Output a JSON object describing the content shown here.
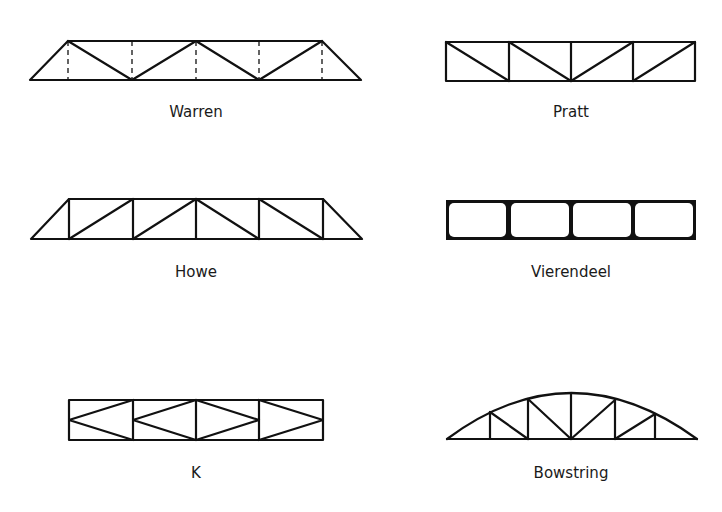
{
  "figure": {
    "colors": {
      "line": "#111111",
      "background": "#ffffff",
      "text": "#1a1a1a"
    }
  },
  "trusses": [
    {
      "id": "warren",
      "label": "Warren",
      "shape": "trapezoid",
      "panels": 4,
      "verticals": "dashed (zero-force)",
      "diagonals": "alternating V pattern"
    },
    {
      "id": "pratt",
      "label": "Pratt",
      "shape": "rectangle",
      "panels": 4,
      "verticals": "solid",
      "diagonals": "slope down toward center"
    },
    {
      "id": "howe",
      "label": "Howe",
      "shape": "trapezoid",
      "panels": 4,
      "verticals": "solid",
      "diagonals": "slope up toward center"
    },
    {
      "id": "vierendeel",
      "label": "Vierendeel",
      "shape": "rectangle",
      "panels": 4,
      "verticals": "solid with rigid filleted joints",
      "diagonals": "none"
    },
    {
      "id": "k",
      "label": "K",
      "shape": "rectangle",
      "panels": 4,
      "verticals": "solid",
      "diagonals": "K-pattern meeting at mid-height"
    },
    {
      "id": "bowstring",
      "label": "Bowstring",
      "shape": "arch over straight chord",
      "panels": 6,
      "verticals": "solid",
      "diagonals": "slope toward center"
    }
  ]
}
